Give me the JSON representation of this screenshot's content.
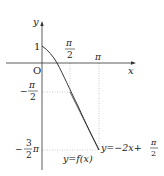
{
  "diagram": {
    "axes": {
      "x_label": "x",
      "y_label": "y",
      "origin_label": "O"
    },
    "x_ticks": [
      {
        "num": "π",
        "den": "2"
      },
      {
        "label": "π"
      }
    ],
    "y_ticks": [
      {
        "label": "1"
      },
      {
        "sign": "−",
        "num": "π",
        "den": "2"
      },
      {
        "sign": "−",
        "num": "3",
        "den": "2",
        "suffix": "π"
      }
    ],
    "curve_label": "y=f(x)",
    "tangent_label": {
      "prefix": "y=−2x+",
      "num": "π",
      "den": "2"
    },
    "colors": {
      "axis": "#333333",
      "curve": "#222222",
      "guide": "#aaaaaa"
    }
  }
}
